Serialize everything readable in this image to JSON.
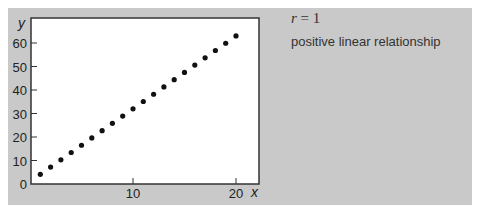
{
  "chart_data": {
    "type": "scatter",
    "title": "",
    "xlabel": "x",
    "ylabel": "y",
    "xlim": [
      0,
      22
    ],
    "ylim": [
      0,
      66
    ],
    "x_ticks": [
      10,
      20
    ],
    "y_ticks": [
      0,
      10,
      20,
      30,
      40,
      50,
      60
    ],
    "grid": false,
    "series": [
      {
        "name": "points",
        "x": [
          1,
          2,
          3,
          4,
          5,
          6,
          7,
          8,
          9,
          10,
          11,
          12,
          13,
          14,
          15,
          16,
          17,
          18,
          19,
          20
        ],
        "y": [
          4.1,
          7.2,
          10.3,
          13.4,
          16.5,
          19.6,
          22.7,
          25.8,
          28.9,
          32.0,
          35.1,
          38.2,
          41.3,
          44.4,
          47.5,
          50.6,
          53.7,
          56.8,
          59.9,
          63.0
        ]
      }
    ],
    "annotations": {
      "r_label": "r",
      "r_equals": " = 1",
      "description": "positive linear relationship"
    }
  },
  "colors": {
    "panel": "#c9c9c9",
    "plot_bg": "#ffffff",
    "point": "#111111"
  }
}
